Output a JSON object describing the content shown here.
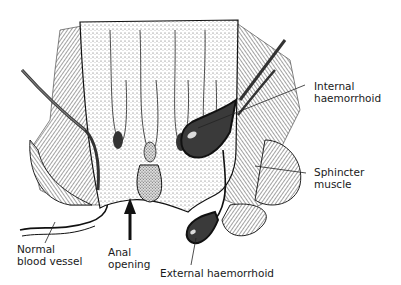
{
  "diagram": {
    "labels": {
      "internal_haemorrhoid": [
        "Internal",
        "haemorrhoid"
      ],
      "sphincter_muscle": [
        "Sphincter",
        "muscle"
      ],
      "normal_blood_vessel": [
        "Normal",
        "blood vessel"
      ],
      "anal_opening": [
        "Anal",
        "opening"
      ],
      "external_haemorrhoid": [
        "External haemorrhoid"
      ]
    },
    "colors": {
      "ink": "#111111",
      "stipple": "#6a6a6a",
      "hatch": "#555555",
      "background": "#ffffff"
    }
  }
}
